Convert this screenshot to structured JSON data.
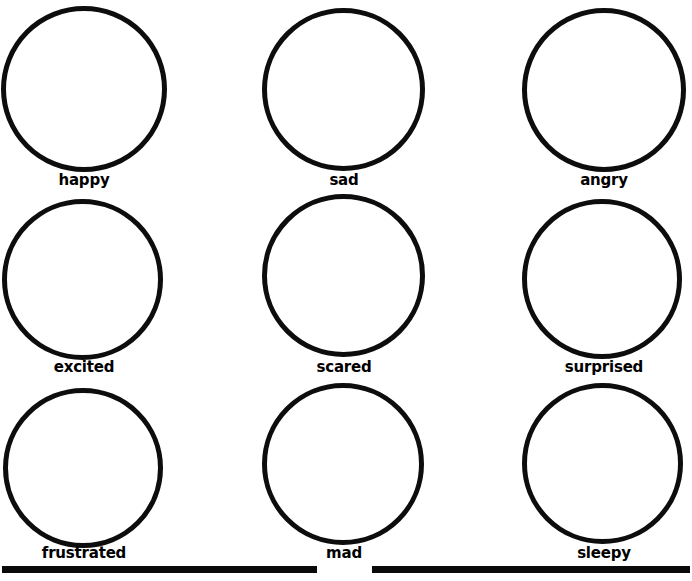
{
  "page": {
    "background_color": "#ffffff",
    "ink_color": "#000000",
    "width": 692,
    "height": 581
  },
  "grid": {
    "rows": 3,
    "columns": 3,
    "cells": [
      {
        "label": "happy",
        "row": 1,
        "column": 1,
        "circle": {
          "left": 1,
          "top": 6,
          "size": 166,
          "stroke": 5
        },
        "label_box": {
          "left": 0,
          "top": 172,
          "width": 168
        }
      },
      {
        "label": "sad",
        "row": 1,
        "column": 2,
        "circle": {
          "left": 262,
          "top": 8,
          "size": 163,
          "stroke": 5
        },
        "label_box": {
          "left": 260,
          "top": 172,
          "width": 168
        }
      },
      {
        "label": "angry",
        "row": 1,
        "column": 3,
        "circle": {
          "left": 522,
          "top": 8,
          "size": 164,
          "stroke": 5
        },
        "label_box": {
          "left": 520,
          "top": 172,
          "width": 168
        }
      },
      {
        "label": "excited",
        "row": 2,
        "column": 1,
        "circle": {
          "left": 2,
          "top": 199,
          "size": 161,
          "stroke": 5
        },
        "label_box": {
          "left": 0,
          "top": 359,
          "width": 168
        }
      },
      {
        "label": "scared",
        "row": 2,
        "column": 2,
        "circle": {
          "left": 262,
          "top": 194,
          "size": 163,
          "stroke": 5
        },
        "label_box": {
          "left": 260,
          "top": 359,
          "width": 168
        }
      },
      {
        "label": "surprised",
        "row": 2,
        "column": 3,
        "circle": {
          "left": 522,
          "top": 199,
          "size": 160,
          "stroke": 5
        },
        "label_box": {
          "left": 520,
          "top": 359,
          "width": 168
        }
      },
      {
        "label": "frustrated",
        "row": 3,
        "column": 1,
        "circle": {
          "left": 3,
          "top": 388,
          "size": 160,
          "stroke": 5
        },
        "label_box": {
          "left": 0,
          "top": 545,
          "width": 168
        }
      },
      {
        "label": "mad",
        "row": 3,
        "column": 2,
        "circle": {
          "left": 262,
          "top": 383,
          "size": 162,
          "stroke": 5
        },
        "label_box": {
          "left": 260,
          "top": 545,
          "width": 168
        }
      },
      {
        "label": "sleepy",
        "row": 3,
        "column": 3,
        "circle": {
          "left": 522,
          "top": 383,
          "size": 161,
          "stroke": 5
        },
        "label_box": {
          "left": 520,
          "top": 545,
          "width": 168
        }
      }
    ]
  },
  "footer_rules": [
    {
      "left": 2,
      "top": 566,
      "width": 315,
      "height": 7
    },
    {
      "left": 372,
      "top": 566,
      "width": 318,
      "height": 7
    }
  ]
}
